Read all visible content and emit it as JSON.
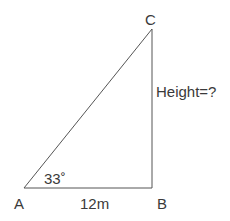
{
  "diagram": {
    "type": "right-triangle",
    "vertices": {
      "A": {
        "label": "A",
        "x": 24,
        "y": 188
      },
      "B": {
        "label": "B",
        "x": 152,
        "y": 188
      },
      "C": {
        "label": "C",
        "x": 152,
        "y": 29
      }
    },
    "labels": {
      "vertex_a": "A",
      "vertex_b": "B",
      "vertex_c": "C",
      "angle_a": "33˚",
      "base_ab": "12m",
      "height_bc": "Height=?"
    },
    "colors": {
      "stroke": "#555555",
      "text": "#3a3a3a",
      "background": "#ffffff"
    }
  }
}
